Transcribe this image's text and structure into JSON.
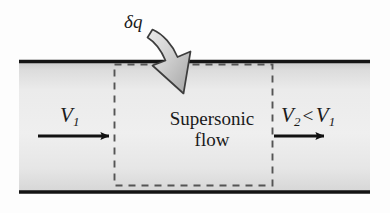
{
  "figure": {
    "name": "supersonic-duct-heat-addition-diagram",
    "caption_labels": {
      "heat_symbol": "δq",
      "inlet_velocity": "V",
      "inlet_velocity_sub": "1",
      "outlet_velocity": "V",
      "outlet_velocity_sub": "2",
      "comparison_operator": "<",
      "outlet_compare_velocity": "V",
      "outlet_compare_sub": "1",
      "region_line1": "Supersonic",
      "region_line2": "flow"
    }
  },
  "colors": {
    "page_background": "#fdfdfd",
    "duct_fill_light": "#ececec",
    "duct_fill_shade": "#c9c9c9",
    "wall_stroke": "#141414",
    "dashed_stroke": "#555555",
    "arrow_stroke": "#111111",
    "block_arrow_fill_light": "#e2e2e2",
    "block_arrow_fill_dark": "#a8a8a8",
    "block_arrow_stroke": "#3d3d3d",
    "text": "#1a1a1a"
  },
  "geometry": {
    "duct": {
      "x": 19,
      "y": 60,
      "width": 351,
      "height": 133
    },
    "control_volume": {
      "x": 114,
      "y": 64,
      "width": 159,
      "height": 122
    },
    "inlet_arrow": {
      "x1": 38,
      "y1": 136,
      "x2": 113,
      "y2": 136
    },
    "outlet_arrow": {
      "x1": 274,
      "y1": 136,
      "x2": 328,
      "y2": 136
    },
    "heat_arrow": {
      "start_x": 152,
      "start_y": 30,
      "tip_x": 183,
      "tip_y": 93
    }
  },
  "elements": {
    "top_wall": "duct-top-wall",
    "bottom_wall": "duct-bottom-wall",
    "control_volume_box": "control-volume-dashed-box",
    "heat_arrow": "heat-addition-arrow"
  }
}
